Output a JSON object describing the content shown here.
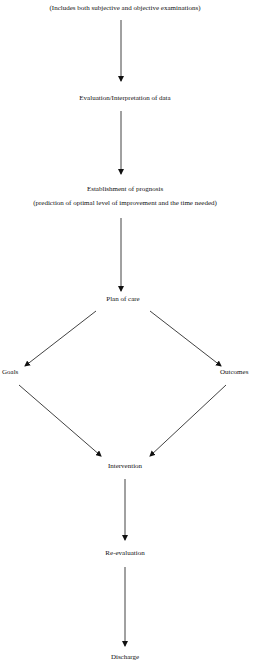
{
  "diagram": {
    "type": "flowchart",
    "nodes": {
      "examination_note": "(Includes both subjective and objective examinations)",
      "evaluation": "Evaluation/Interpretation of data",
      "prognosis_title": "Establishment of prognosis",
      "prognosis_note": "(prediction of optimal level of improvement and the time needed)",
      "plan_of_care": "Plan of care",
      "goals": "Goals",
      "outcomes": "Outcomes",
      "intervention": "Intervention",
      "reevaluation": "Re-evaluation",
      "discharge": "Discharge"
    },
    "edges": [
      {
        "from": "examination_note",
        "to": "evaluation"
      },
      {
        "from": "evaluation",
        "to": "prognosis_title"
      },
      {
        "from": "prognosis_note",
        "to": "plan_of_care"
      },
      {
        "from": "plan_of_care",
        "to": "goals"
      },
      {
        "from": "plan_of_care",
        "to": "outcomes"
      },
      {
        "from": "goals",
        "to": "intervention"
      },
      {
        "from": "outcomes",
        "to": "intervention"
      },
      {
        "from": "intervention",
        "to": "reevaluation"
      },
      {
        "from": "reevaluation",
        "to": "discharge"
      }
    ],
    "colors": {
      "line": "#111111",
      "background": "#ffffff"
    }
  }
}
